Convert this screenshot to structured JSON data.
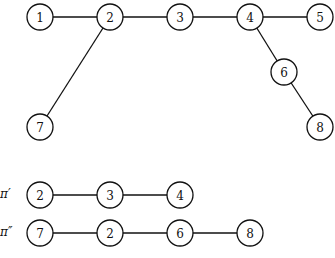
{
  "tree": {
    "nodes": [
      {
        "id": "1",
        "x": 40,
        "y": 17
      },
      {
        "id": "2",
        "x": 110,
        "y": 17
      },
      {
        "id": "3",
        "x": 180,
        "y": 17
      },
      {
        "id": "4",
        "x": 250,
        "y": 17
      },
      {
        "id": "5",
        "x": 320,
        "y": 17
      },
      {
        "id": "6",
        "x": 284,
        "y": 72
      },
      {
        "id": "7",
        "x": 40,
        "y": 127
      },
      {
        "id": "8",
        "x": 320,
        "y": 127
      }
    ],
    "edges": [
      [
        "1",
        "2"
      ],
      [
        "2",
        "3"
      ],
      [
        "3",
        "4"
      ],
      [
        "4",
        "5"
      ],
      [
        "2",
        "7"
      ],
      [
        "4",
        "6"
      ],
      [
        "6",
        "8"
      ]
    ]
  },
  "paths": [
    {
      "label": "π′",
      "y": 195,
      "nodes": [
        {
          "id": "2",
          "x": 40
        },
        {
          "id": "3",
          "x": 110
        },
        {
          "id": "4",
          "x": 180
        }
      ]
    },
    {
      "label": "π″",
      "y": 233,
      "nodes": [
        {
          "id": "7",
          "x": 40
        },
        {
          "id": "2",
          "x": 110
        },
        {
          "id": "6",
          "x": 180
        },
        {
          "id": "8",
          "x": 250
        }
      ]
    }
  ],
  "node_radius": 13
}
